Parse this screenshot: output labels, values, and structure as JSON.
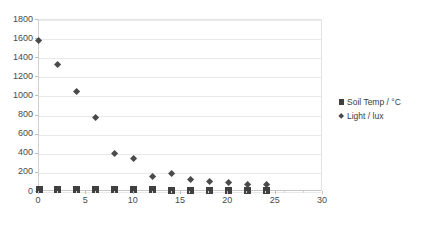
{
  "chart_data": {
    "type": "scatter",
    "title": "",
    "subtitle": "",
    "xlabel": "",
    "ylabel": "",
    "xlim": [
      0,
      30
    ],
    "ylim": [
      0,
      1800
    ],
    "ytick_step": 200,
    "xtick_step": 5,
    "x_minor_step": 2,
    "grid": "horizontal",
    "legend_position": "right",
    "x_tick_labels": [
      "0",
      "5",
      "10",
      "15",
      "20",
      "25",
      "30"
    ],
    "y_tick_labels": [
      "0",
      "200",
      "400",
      "600",
      "800",
      "1000",
      "1200",
      "1400",
      "1600",
      "1800"
    ],
    "x_minor_ticks": [
      0,
      2,
      4,
      6,
      8,
      10,
      12,
      14,
      16,
      18,
      20,
      22,
      24,
      26,
      28,
      30
    ],
    "series": [
      {
        "name": "Soil Temp / °C",
        "marker": "square",
        "color": "#404040",
        "x": [
          0,
          2,
          4,
          6,
          8,
          10,
          12,
          14,
          16,
          18,
          20,
          22,
          24
        ],
        "values": [
          25,
          24,
          23,
          22,
          22,
          21,
          21,
          20,
          20,
          20,
          20,
          19,
          19
        ]
      },
      {
        "name": "Light / lux",
        "marker": "diamond",
        "color": "#4a4a4a",
        "x": [
          0,
          2,
          4,
          6,
          8,
          10,
          12,
          14,
          16,
          18,
          20,
          22,
          24
        ],
        "values": [
          1580,
          1335,
          1055,
          780,
          400,
          345,
          160,
          190,
          125,
          110,
          95,
          80,
          75
        ]
      }
    ]
  },
  "legend": {
    "entries": [
      {
        "label": "Soil Temp / °C",
        "marker": "square-marker-icon"
      },
      {
        "label": "Light / lux",
        "marker": "diamond-marker-icon"
      }
    ]
  },
  "colors": {
    "background": "#ffffff",
    "gridline": "#e9e9e9",
    "axis": "#c8c8c8",
    "tick_text": "#4a4a4a",
    "series_soil_temp": "#404040",
    "series_light": "#4a4a4a"
  }
}
